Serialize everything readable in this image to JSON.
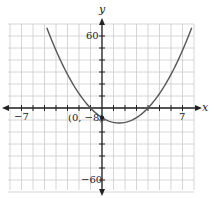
{
  "chart_data": {
    "type": "line",
    "title": "",
    "xlabel": "x",
    "ylabel": "y",
    "xlim": [
      -7,
      7
    ],
    "ylim": [
      -60,
      60
    ],
    "x_tick_labels": [
      "-7",
      "7"
    ],
    "y_tick_labels": [
      "60",
      "-60"
    ],
    "grid": true,
    "series": [
      {
        "name": "parabola",
        "equation": "y = 2x^2 - 6x - 8",
        "x": [
          -4.8,
          -4,
          -3,
          -2,
          -1,
          0,
          1,
          1.5,
          2,
          3,
          4,
          5,
          6,
          7,
          7.8
        ],
        "values": [
          66.8,
          48,
          28,
          12,
          0,
          -8,
          -12,
          -12.5,
          -12,
          -8,
          0,
          12,
          28,
          48,
          67.1
        ],
        "color": "#555555"
      }
    ],
    "annotations": [
      {
        "text": "(0, −8)",
        "x": 0,
        "y": -8
      }
    ]
  },
  "labels": {
    "x_axis": "x",
    "y_axis": "y",
    "x_min": "−7",
    "x_max": "7",
    "y_max": "60",
    "y_min": "−60",
    "point": "(0, −8)"
  }
}
